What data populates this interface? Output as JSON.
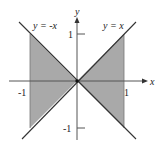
{
  "diagram": {
    "type": "region-plot",
    "axes": {
      "x_label": "x",
      "y_label": "y",
      "x_ticks": [
        "-1",
        "1"
      ],
      "y_ticks": [
        "1",
        "-1"
      ]
    },
    "lines": [
      {
        "label": "y = -x",
        "slope": -1
      },
      {
        "label": "y = x",
        "slope": 1
      }
    ],
    "region": {
      "x_range": [
        -1,
        1
      ],
      "bounds": "-|x| <= y <= |x|",
      "fill_color": "#a9a9a9"
    },
    "colors": {
      "line": "#333333",
      "axis": "#555555",
      "fill": "#a9a9a9"
    }
  }
}
